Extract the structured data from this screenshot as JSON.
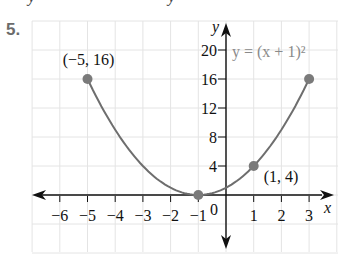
{
  "problem": {
    "number": "5."
  },
  "top_cutoff": {
    "left_glyph": "y",
    "right_glyph": "y"
  },
  "chart_data": {
    "type": "line",
    "title": "",
    "equation_label": "y = (x + 1)²",
    "xlabel": "x",
    "ylabel": "y",
    "xlim": [
      -6.5,
      3.8
    ],
    "ylim": [
      -6,
      22
    ],
    "grid": true,
    "x_ticks": [
      -6,
      -5,
      -4,
      -3,
      -2,
      -1,
      1,
      2,
      3
    ],
    "x_tick_labels": [
      "−6",
      "−5",
      "−4",
      "−3",
      "−2",
      "−1",
      "1",
      "2",
      "3"
    ],
    "y_ticks": [
      4,
      8,
      12,
      16,
      20
    ],
    "y_tick_labels": [
      "4",
      "8",
      "12",
      "16",
      "20"
    ],
    "origin_label": "0",
    "series": [
      {
        "name": "y = (x + 1)^2",
        "domain": [
          -5,
          3
        ],
        "x": [
          -5,
          -4,
          -3,
          -2,
          -1,
          0,
          1,
          2,
          3
        ],
        "values": [
          16,
          9,
          4,
          1,
          0,
          1,
          4,
          9,
          16
        ]
      }
    ],
    "highlighted_points": [
      {
        "x": -5,
        "y": 16,
        "label": "(−5, 16)"
      },
      {
        "x": -1,
        "y": 0,
        "label": ""
      },
      {
        "x": 1,
        "y": 4,
        "label": "(1, 4)"
      },
      {
        "x": 3,
        "y": 16,
        "label": ""
      }
    ],
    "colors": {
      "curve": "#6e6e6e",
      "point": "#7a7a7a",
      "axis": "#111111",
      "grid": "#e4e4e4",
      "equation": "#8a8a8a"
    }
  }
}
